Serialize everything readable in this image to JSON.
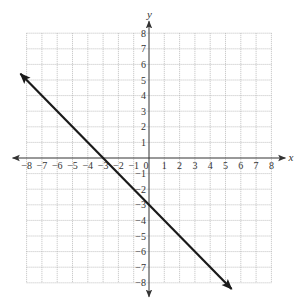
{
  "chart_data": {
    "type": "line",
    "title": "",
    "xlabel": "x",
    "ylabel": "y",
    "xlim": [
      -8,
      8
    ],
    "ylim": [
      -8,
      8
    ],
    "grid": true,
    "grid_style": "dotted",
    "x_ticks": [
      -8,
      -7,
      -6,
      -5,
      -4,
      -3,
      -2,
      -1,
      0,
      1,
      2,
      3,
      4,
      5,
      6,
      7,
      8
    ],
    "y_ticks": [
      -8,
      -7,
      -6,
      -5,
      -4,
      -3,
      -2,
      -1,
      1,
      2,
      3,
      4,
      5,
      6,
      7,
      8
    ],
    "series": [
      {
        "name": "line",
        "equation": "y = -x - 3",
        "slope": -1,
        "intercept": -3,
        "x": [
          -8.4,
          5.4
        ],
        "y": [
          5.4,
          -8.4
        ],
        "arrows": "both",
        "color": "#1a1a1a"
      }
    ],
    "key_points": [
      {
        "x": -3,
        "y": 0,
        "label": "x-intercept"
      },
      {
        "x": 0,
        "y": -3,
        "label": "y-intercept"
      }
    ]
  },
  "colors": {
    "axis": "#333333",
    "grid": "#b0b0b0",
    "line": "#1a1a1a"
  }
}
